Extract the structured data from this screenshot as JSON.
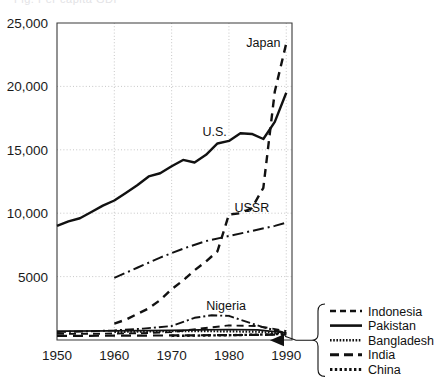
{
  "figure": {
    "clipped_header_text": "Fig. Per capita GDP",
    "background_color": "#ffffff",
    "line_color": "#111111",
    "grid_color": "#b9b9b9",
    "frame_color": "#3a3a3a"
  },
  "chart_data": {
    "type": "line",
    "title": "",
    "subtitle": "",
    "xlabel": "",
    "ylabel": "",
    "xlim": [
      1950,
      1991
    ],
    "ylim": [
      0,
      25000
    ],
    "grid": true,
    "x_ticks": [
      1950,
      1960,
      1970,
      1980,
      1990
    ],
    "x_tick_labels": [
      "1950",
      "1960",
      "1970",
      "1980",
      "1990"
    ],
    "y_ticks": [
      5000,
      10000,
      15000,
      20000,
      25000
    ],
    "y_tick_labels": [
      "5000",
      "10,000",
      "15,000",
      "20,000",
      "25,000"
    ],
    "legend_position": "bottom-right-outside",
    "annotations": [
      {
        "text": "Japan",
        "x": 1986.0,
        "y": 23100,
        "name": "japan"
      },
      {
        "text": "U.S.",
        "x": 1977.5,
        "y": 16100,
        "name": "us"
      },
      {
        "text": "USSR",
        "x": 1984.0,
        "y": 10100,
        "name": "ussr"
      },
      {
        "text": "Nigeria",
        "x": 1979.5,
        "y": 2350,
        "name": "nigeria"
      }
    ],
    "series": [
      {
        "name": "Japan",
        "style": "dashed",
        "dasharray": "8 6",
        "width": 2.4,
        "x": [
          1960,
          1962,
          1964,
          1966,
          1968,
          1970,
          1972,
          1974,
          1976,
          1978,
          1980,
          1982,
          1984,
          1986,
          1988,
          1990
        ],
        "values": [
          1300,
          1600,
          2050,
          2500,
          3150,
          4000,
          4700,
          5500,
          6200,
          7000,
          9900,
          10000,
          10400,
          12000,
          19600,
          23400
        ]
      },
      {
        "name": "U.S.",
        "style": "solid",
        "dasharray": "none",
        "width": 2.4,
        "x": [
          1950,
          1952,
          1954,
          1956,
          1958,
          1960,
          1962,
          1964,
          1966,
          1968,
          1970,
          1972,
          1974,
          1976,
          1978,
          1980,
          1982,
          1984,
          1986,
          1988,
          1990
        ],
        "values": [
          9000,
          9350,
          9600,
          10100,
          10600,
          11000,
          11600,
          12200,
          12900,
          13150,
          13700,
          14200,
          14000,
          14600,
          15500,
          15700,
          16300,
          16250,
          15850,
          17200,
          19500
        ]
      },
      {
        "name": "USSR",
        "style": "dash-dot",
        "dasharray": "11 4 2 4",
        "width": 2.0,
        "x": [
          1960,
          1964,
          1968,
          1972,
          1976,
          1980,
          1984,
          1988,
          1990
        ],
        "values": [
          4900,
          5700,
          6500,
          7200,
          7800,
          8200,
          8600,
          9000,
          9250
        ]
      },
      {
        "name": "Nigeria",
        "style": "dash-dot",
        "dasharray": "9 3 2 3",
        "width": 1.9,
        "x": [
          1950,
          1955,
          1960,
          1965,
          1970,
          1974,
          1977,
          1980,
          1983,
          1986,
          1990
        ],
        "values": [
          620,
          680,
          760,
          900,
          1100,
          1750,
          1950,
          1900,
          1450,
          1000,
          550
        ]
      },
      {
        "name": "Indonesia",
        "style": "dashed",
        "dasharray": "7 5",
        "width": 1.9,
        "x": [
          1950,
          1958,
          1965,
          1970,
          1975,
          1980,
          1985,
          1990
        ],
        "values": [
          480,
          500,
          540,
          620,
          900,
          1150,
          1100,
          700
        ]
      },
      {
        "name": "Pakistan",
        "style": "solid",
        "dasharray": "none",
        "width": 1.6,
        "x": [
          1950,
          1960,
          1970,
          1975,
          1980,
          1985,
          1990
        ],
        "values": [
          700,
          720,
          760,
          800,
          830,
          800,
          560
        ]
      },
      {
        "name": "Bangladesh",
        "style": "dotted-fine",
        "dasharray": "1.6 1.6",
        "width": 2.2,
        "x": [
          1960,
          1965,
          1970,
          1975,
          1980,
          1985,
          1990
        ],
        "values": [
          640,
          660,
          700,
          700,
          680,
          650,
          500
        ]
      },
      {
        "name": "India",
        "style": "long-dash",
        "dasharray": "10 6",
        "width": 2.2,
        "x": [
          1950,
          1960,
          1970,
          1978,
          1984,
          1990
        ],
        "values": [
          320,
          340,
          360,
          380,
          400,
          430
        ]
      },
      {
        "name": "China",
        "style": "dotted",
        "dasharray": "2.6 2.6",
        "width": 2.4,
        "x": [
          1970,
          1975,
          1980,
          1985,
          1988,
          1990
        ],
        "values": [
          330,
          350,
          380,
          420,
          460,
          480
        ]
      }
    ]
  },
  "legend": {
    "items": [
      {
        "label": "Indonesia",
        "style": "dashed",
        "dasharray": "6 4",
        "width": 2.6
      },
      {
        "label": "Pakistan",
        "style": "solid",
        "dasharray": "none",
        "width": 2.6
      },
      {
        "label": "Bangladesh",
        "style": "dotted-fine",
        "dasharray": "1.6 1.6",
        "width": 2.6
      },
      {
        "label": "India",
        "style": "long-dash",
        "dasharray": "9 5",
        "width": 3.0
      },
      {
        "label": "China",
        "style": "dotted",
        "dasharray": "2.4 2.4",
        "width": 3.0
      }
    ]
  }
}
